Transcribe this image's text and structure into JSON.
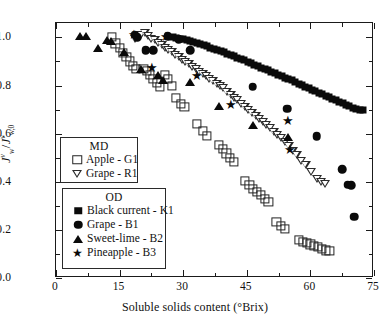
{
  "figure": {
    "background": "#ffffff",
    "frame_color": "#1a1a1a"
  },
  "axes": {
    "x": {
      "title_main": "Soluble solids content (",
      "title_unit": "°Brix)",
      "title_full": "Soluble solids content (°Brix)",
      "min": 0,
      "max": 75,
      "major_ticks": [
        0,
        15,
        30,
        45,
        60,
        75
      ],
      "minor_ticks": [
        7.5,
        22.5,
        37.5,
        52.5,
        67.5
      ],
      "tick_labels": [
        "0",
        "15",
        "30",
        "45",
        "60",
        "75"
      ]
    },
    "y": {
      "title_full": "Jᵥw / Jᵥw,0",
      "min": 0.0,
      "max": 1.06,
      "major_ticks": [
        0.0,
        0.2,
        0.4,
        0.6,
        0.8,
        1.0
      ],
      "minor_ticks": [
        0.1,
        0.3,
        0.5,
        0.7,
        0.9
      ],
      "tick_labels": [
        "0.0",
        "0.2",
        "0.4",
        "0.6",
        "0.8",
        "1.0"
      ]
    }
  },
  "legends": [
    {
      "id": "MD",
      "title": "MD",
      "entries": [
        {
          "label": "Apple - G1",
          "marker": "open-square",
          "color": "#232323"
        },
        {
          "label": "Grape - R1",
          "marker": "open-triangle-down",
          "color": "#2a2a2a"
        }
      ]
    },
    {
      "id": "OD",
      "title": "OD",
      "entries": [
        {
          "label": "Black current - K1",
          "marker": "filled-square",
          "color": "#0a0a0a"
        },
        {
          "label": "Grape - B1",
          "marker": "filled-circle",
          "color": "#0a0a0a"
        },
        {
          "label": "Sweet-lime - B2",
          "marker": "filled-triangle-up",
          "color": "#0a0a0a"
        },
        {
          "label": "Pineapple - B3",
          "marker": "filled-star",
          "color": "#0a0a0a"
        }
      ]
    }
  ],
  "chart_data": {
    "type": "scatter",
    "title": "",
    "xlabel": "Soluble solids content (°Brix)",
    "ylabel": "Jᵥw / Jᵥw,0",
    "xlim": [
      0,
      75
    ],
    "ylim": [
      0.0,
      1.06
    ],
    "grid": false,
    "legend_position": "inner-left",
    "series": [
      {
        "name": "Apple - G1",
        "group": "MD",
        "marker": "open-square",
        "color": "#232323",
        "points": [
          [
            13.2,
            1.002
          ],
          [
            14.0,
            0.975
          ],
          [
            15.0,
            0.958
          ],
          [
            15.8,
            0.935
          ],
          [
            16.6,
            0.918
          ],
          [
            17.4,
            0.9
          ],
          [
            18.2,
            0.882
          ],
          [
            18.9,
            0.87
          ],
          [
            20.6,
            0.868
          ],
          [
            21.4,
            0.862
          ],
          [
            22.1,
            0.845
          ],
          [
            22.9,
            0.828
          ],
          [
            23.8,
            0.812
          ],
          [
            24.6,
            0.795
          ],
          [
            25.6,
            0.845
          ],
          [
            26.4,
            0.828
          ],
          [
            27.4,
            0.8
          ],
          [
            28.2,
            0.748
          ],
          [
            29.4,
            0.722
          ],
          [
            30.3,
            0.71
          ],
          [
            33.2,
            0.64
          ],
          [
            34.6,
            0.612
          ],
          [
            35.5,
            0.59
          ],
          [
            38.4,
            0.552
          ],
          [
            39.3,
            0.535
          ],
          [
            40.2,
            0.518
          ],
          [
            41.0,
            0.5
          ],
          [
            41.9,
            0.482
          ],
          [
            44.6,
            0.402
          ],
          [
            45.6,
            0.388
          ],
          [
            46.5,
            0.372
          ],
          [
            47.4,
            0.358
          ],
          [
            48.3,
            0.345
          ],
          [
            49.2,
            0.33
          ],
          [
            50.1,
            0.318
          ],
          [
            52.0,
            0.232
          ],
          [
            53.0,
            0.218
          ],
          [
            53.9,
            0.205
          ],
          [
            57.2,
            0.158
          ],
          [
            58.2,
            0.15
          ],
          [
            59.1,
            0.145
          ],
          [
            60.0,
            0.14
          ],
          [
            60.9,
            0.135
          ],
          [
            61.8,
            0.128
          ],
          [
            62.7,
            0.122
          ],
          [
            63.6,
            0.115
          ],
          [
            64.5,
            0.112
          ]
        ]
      },
      {
        "name": "Grape - R1",
        "group": "MD",
        "marker": "open-triangle-down",
        "color": "#2a2a2a",
        "points": [
          [
            18.6,
            0.995
          ],
          [
            19.3,
            1.005
          ],
          [
            20.1,
            1.012
          ],
          [
            20.9,
            1.018
          ],
          [
            21.7,
            1.005
          ],
          [
            22.5,
            0.995
          ],
          [
            23.3,
            0.99
          ],
          [
            24.1,
            0.978
          ],
          [
            24.9,
            0.968
          ],
          [
            25.7,
            0.958
          ],
          [
            26.5,
            0.948
          ],
          [
            27.3,
            0.938
          ],
          [
            28.1,
            0.928
          ],
          [
            28.9,
            0.918
          ],
          [
            29.7,
            0.908
          ],
          [
            30.5,
            0.898
          ],
          [
            31.3,
            0.888
          ],
          [
            32.1,
            0.878
          ],
          [
            33.0,
            0.868
          ],
          [
            33.8,
            0.858
          ],
          [
            34.6,
            0.848
          ],
          [
            35.4,
            0.838
          ],
          [
            36.2,
            0.828
          ],
          [
            37.0,
            0.818
          ],
          [
            37.9,
            0.808
          ],
          [
            38.7,
            0.798
          ],
          [
            39.5,
            0.788
          ],
          [
            40.3,
            0.775
          ],
          [
            41.2,
            0.762
          ],
          [
            42.0,
            0.75
          ],
          [
            42.8,
            0.738
          ],
          [
            43.7,
            0.722
          ],
          [
            44.5,
            0.71
          ],
          [
            45.4,
            0.698
          ],
          [
            46.2,
            0.685
          ],
          [
            47.1,
            0.672
          ],
          [
            47.9,
            0.66
          ],
          [
            48.8,
            0.648
          ],
          [
            49.6,
            0.635
          ],
          [
            50.5,
            0.622
          ],
          [
            51.3,
            0.608
          ],
          [
            52.2,
            0.595
          ],
          [
            53.1,
            0.58
          ],
          [
            54.0,
            0.565
          ],
          [
            54.9,
            0.548
          ],
          [
            55.8,
            0.53
          ],
          [
            56.8,
            0.51
          ],
          [
            57.8,
            0.488
          ],
          [
            58.9,
            0.468
          ],
          [
            60.2,
            0.442
          ],
          [
            61.6,
            0.412
          ],
          [
            62.6,
            0.398
          ],
          [
            63.5,
            0.39
          ]
        ]
      },
      {
        "name": "Black current - K1",
        "group": "OD",
        "marker": "filled-square",
        "color": "#0a0a0a",
        "points": [
          [
            27.6,
            1.0
          ],
          [
            28.4,
            0.998
          ],
          [
            29.2,
            0.995
          ],
          [
            30.0,
            0.992
          ],
          [
            30.8,
            0.988
          ],
          [
            31.6,
            0.984
          ],
          [
            32.4,
            0.98
          ],
          [
            33.2,
            0.976
          ],
          [
            34.0,
            0.972
          ],
          [
            34.8,
            0.968
          ],
          [
            35.6,
            0.963
          ],
          [
            36.4,
            0.958
          ],
          [
            37.2,
            0.953
          ],
          [
            38.0,
            0.948
          ],
          [
            38.8,
            0.943
          ],
          [
            39.6,
            0.938
          ],
          [
            40.4,
            0.932
          ],
          [
            41.2,
            0.927
          ],
          [
            42.0,
            0.921
          ],
          [
            42.8,
            0.916
          ],
          [
            43.6,
            0.91
          ],
          [
            44.4,
            0.905
          ],
          [
            45.2,
            0.899
          ],
          [
            46.0,
            0.893
          ],
          [
            46.8,
            0.887
          ],
          [
            47.6,
            0.881
          ],
          [
            48.4,
            0.875
          ],
          [
            49.2,
            0.869
          ],
          [
            50.0,
            0.863
          ],
          [
            50.8,
            0.857
          ],
          [
            51.6,
            0.851
          ],
          [
            52.4,
            0.845
          ],
          [
            53.2,
            0.839
          ],
          [
            54.0,
            0.833
          ],
          [
            54.8,
            0.827
          ],
          [
            55.6,
            0.821
          ],
          [
            56.4,
            0.814
          ],
          [
            57.2,
            0.808
          ],
          [
            58.0,
            0.802
          ],
          [
            58.8,
            0.796
          ],
          [
            59.6,
            0.789
          ],
          [
            60.4,
            0.783
          ],
          [
            61.2,
            0.777
          ],
          [
            62.0,
            0.77
          ],
          [
            62.8,
            0.764
          ],
          [
            63.6,
            0.758
          ],
          [
            64.4,
            0.751
          ],
          [
            65.2,
            0.745
          ],
          [
            66.0,
            0.738
          ],
          [
            66.8,
            0.732
          ],
          [
            67.6,
            0.726
          ],
          [
            68.4,
            0.719
          ],
          [
            69.2,
            0.713
          ],
          [
            70.0,
            0.707
          ],
          [
            70.8,
            0.702
          ],
          [
            71.6,
            0.698
          ],
          [
            72.4,
            0.7
          ]
        ]
      },
      {
        "name": "Grape - B1",
        "group": "OD",
        "marker": "filled-circle",
        "color": "#0a0a0a",
        "points": [
          [
            18.6,
            1.012
          ],
          [
            19.2,
            1.0
          ],
          [
            21.2,
            0.948
          ],
          [
            22.9,
            0.948
          ],
          [
            26.3,
            1.005
          ],
          [
            28.9,
            0.992
          ],
          [
            31.7,
            0.948
          ],
          [
            46.4,
            0.795
          ],
          [
            54.5,
            0.703
          ],
          [
            61.5,
            0.59
          ],
          [
            67.5,
            0.452
          ],
          [
            68.8,
            0.388
          ],
          [
            69.6,
            0.385
          ],
          [
            70.4,
            0.255
          ]
        ]
      },
      {
        "name": "Sweet-lime - B2",
        "group": "OD",
        "marker": "filled-triangle-up",
        "color": "#0a0a0a",
        "points": [
          [
            5.6,
            1.008
          ],
          [
            7.1,
            1.008
          ],
          [
            10.0,
            0.955
          ],
          [
            12.1,
            0.99
          ],
          [
            12.9,
            0.985
          ],
          [
            16.0,
            0.94
          ],
          [
            20.1,
            0.868
          ],
          [
            24.0,
            0.845
          ],
          [
            25.2,
            0.822
          ],
          [
            31.5,
            0.815
          ],
          [
            38.4,
            0.715
          ],
          [
            46.4,
            0.635
          ],
          [
            54.8,
            0.588
          ]
        ]
      },
      {
        "name": "Pineapple - B3",
        "group": "OD",
        "marker": "filled-star",
        "color": "#0a0a0a",
        "points": [
          [
            18.5,
            1.01
          ],
          [
            22.7,
            0.872
          ],
          [
            26.0,
            1.0
          ],
          [
            33.2,
            0.838
          ],
          [
            41.3,
            0.718
          ],
          [
            54.8,
            0.652
          ],
          [
            55.3,
            0.532
          ]
        ]
      }
    ]
  }
}
